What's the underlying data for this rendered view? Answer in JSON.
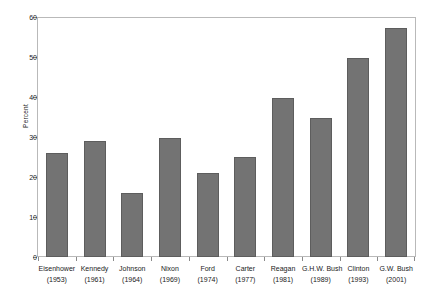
{
  "chart_data": {
    "type": "bar",
    "title": "",
    "subtitle": "",
    "xlabel": "",
    "ylabel": "Percent",
    "ylim": [
      0,
      60
    ],
    "yticks": [
      0,
      10,
      20,
      30,
      40,
      50,
      60
    ],
    "ytick_labels": [
      "0",
      "10",
      "20",
      "30",
      "40",
      "50",
      "60"
    ],
    "grid": false,
    "legend": false,
    "bar_color": "#737373",
    "bar_edge_color": "#5d5d5d",
    "frame_color": "#b9b9b9",
    "categories": [
      "Eisenhower",
      "Kennedy",
      "Johnson",
      "Nixon",
      "Ford",
      "Carter",
      "Reagan",
      "G.H.W. Bush",
      "Clinton",
      "G.W. Bush"
    ],
    "category_years": [
      "(1953)",
      "(1961)",
      "(1964)",
      "(1969)",
      "(1974)",
      "(1977)",
      "(1981)",
      "(1989)",
      "(1993)",
      "(2001)"
    ],
    "values": [
      26,
      29,
      16,
      30,
      21,
      25,
      40,
      35,
      50,
      57.5
    ],
    "bars": [
      {
        "label": "Eisenhower",
        "year": "(1953)",
        "value": 26
      },
      {
        "label": "Kennedy",
        "year": "(1961)",
        "value": 29
      },
      {
        "label": "Johnson",
        "year": "(1964)",
        "value": 16
      },
      {
        "label": "Nixon",
        "year": "(1969)",
        "value": 30
      },
      {
        "label": "Ford",
        "year": "(1974)",
        "value": 21
      },
      {
        "label": "Carter",
        "year": "(1977)",
        "value": 25
      },
      {
        "label": "Reagan",
        "year": "(1981)",
        "value": 40
      },
      {
        "label": "G.H.W. Bush",
        "year": "(1989)",
        "value": 35
      },
      {
        "label": "Clinton",
        "year": "(1993)",
        "value": 50
      },
      {
        "label": "G.W. Bush",
        "year": "(2001)",
        "value": 57.5
      }
    ]
  }
}
